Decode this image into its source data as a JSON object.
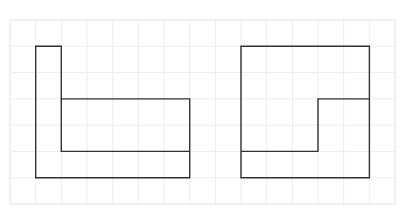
{
  "diagram": {
    "type": "grid-figures",
    "grid": {
      "origin_x": 10,
      "origin_y": 20,
      "cols": 15,
      "rows": 7,
      "cell_w": 25.67,
      "cell_h": 26.29,
      "line_color": "#ececec",
      "border_color": "#e2e2e2"
    },
    "stroke_color": "#333333",
    "stroke_width": 1.4,
    "figures": [
      {
        "name": "left-figure",
        "outline": [
          [
            1,
            1
          ],
          [
            2,
            1
          ],
          [
            2,
            3
          ],
          [
            7,
            3
          ],
          [
            7,
            6
          ],
          [
            1,
            6
          ]
        ],
        "inner_lines": [
          [
            [
              2,
              3
            ],
            [
              2,
              5
            ],
            [
              7,
              5
            ]
          ]
        ]
      },
      {
        "name": "right-figure",
        "outline": [
          [
            9,
            1
          ],
          [
            14,
            1
          ],
          [
            14,
            6
          ],
          [
            9,
            6
          ]
        ],
        "inner_lines": [
          [
            [
              14,
              3
            ],
            [
              12,
              3
            ],
            [
              12,
              5
            ],
            [
              9,
              5
            ]
          ]
        ]
      }
    ]
  }
}
